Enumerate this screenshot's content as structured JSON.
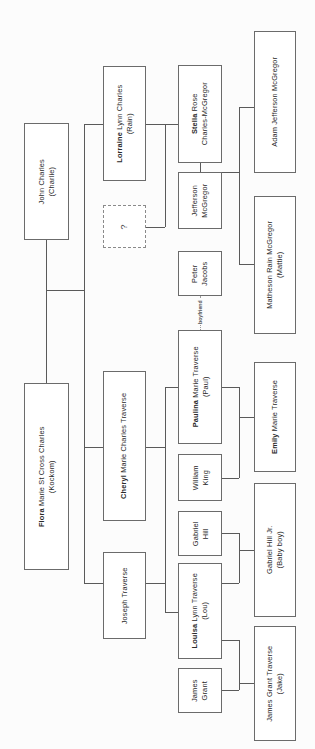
{
  "diagram": {
    "type": "family-tree",
    "orientation": "rotated-90-ccw",
    "nodes": [
      {
        "id": "john-charles",
        "name_bold": "",
        "name_rest": "John Charles",
        "alias": "(Charlie)",
        "x": 24,
        "y": 123,
        "w": 45,
        "h": 117,
        "style": "solid"
      },
      {
        "id": "flora-charles",
        "name_bold": "Flora",
        "name_rest": " Marie St Cross Charles",
        "alias": "(Kockom)",
        "x": 24,
        "y": 383,
        "w": 45,
        "h": 187,
        "style": "solid"
      },
      {
        "id": "lorraine-charles",
        "name_bold": "Lorraine",
        "name_rest": " Lynn Charles",
        "alias": "(Rain)",
        "x": 103,
        "y": 66,
        "w": 43,
        "h": 115,
        "style": "solid"
      },
      {
        "id": "unknown-partner",
        "name_bold": "",
        "name_rest": "?",
        "alias": "",
        "x": 103,
        "y": 205,
        "w": 43,
        "h": 43,
        "style": "dotted"
      },
      {
        "id": "cheryl-traverse",
        "name_bold": "Cheryl",
        "name_rest": " Marie Charles Traverse",
        "alias": "",
        "x": 103,
        "y": 371,
        "w": 43,
        "h": 150,
        "style": "solid"
      },
      {
        "id": "joseph-traverse",
        "name_bold": "",
        "name_rest": "Joseph Traverse",
        "alias": "",
        "x": 103,
        "y": 552,
        "w": 43,
        "h": 87,
        "style": "solid"
      },
      {
        "id": "stella-mcgregor",
        "name_bold": "Stella",
        "name_rest": " Rose",
        "alias": "Charles-McGregor",
        "x": 178,
        "y": 65,
        "w": 44,
        "h": 98,
        "style": "solid"
      },
      {
        "id": "jefferson-mcgregor",
        "name_bold": "",
        "name_rest": "Jefferson",
        "alias": "McGregor",
        "x": 178,
        "y": 172,
        "w": 44,
        "h": 57,
        "style": "solid"
      },
      {
        "id": "peter-jacobs",
        "name_bold": "",
        "name_rest": "Peter",
        "alias": "Jacobs",
        "x": 178,
        "y": 251,
        "w": 44,
        "h": 45,
        "style": "solid"
      },
      {
        "id": "paulina-traverse",
        "name_bold": "Paulina",
        "name_rest": " Marie Traverse",
        "alias": "(Paul)",
        "x": 178,
        "y": 330,
        "w": 44,
        "h": 114,
        "style": "solid"
      },
      {
        "id": "william-king",
        "name_bold": "",
        "name_rest": "William",
        "alias": "King",
        "x": 178,
        "y": 454,
        "w": 44,
        "h": 47,
        "style": "solid"
      },
      {
        "id": "gabriel-hill",
        "name_bold": "",
        "name_rest": "Gabriel",
        "alias": "Hill",
        "x": 178,
        "y": 511,
        "w": 44,
        "h": 45,
        "style": "solid"
      },
      {
        "id": "louisa-traverse",
        "name_bold": "Louisa",
        "name_rest": " Lynn Traverse",
        "alias": "(Lou)",
        "x": 178,
        "y": 563,
        "w": 44,
        "h": 96,
        "style": "solid"
      },
      {
        "id": "james-grant",
        "name_bold": "",
        "name_rest": "James",
        "alias": "Grant",
        "x": 178,
        "y": 668,
        "w": 44,
        "h": 45,
        "style": "solid"
      },
      {
        "id": "adam-mcgregor",
        "name_bold": "",
        "name_rest": "Adam Jefferson McGregor",
        "alias": "",
        "x": 254,
        "y": 31,
        "w": 42,
        "h": 142,
        "style": "solid"
      },
      {
        "id": "matheson-mcgregor",
        "name_bold": "",
        "name_rest": "Matheson Rain McGregor",
        "alias": "(Mattie)",
        "x": 254,
        "y": 196,
        "w": 42,
        "h": 138,
        "style": "solid"
      },
      {
        "id": "emily-traverse",
        "name_bold": "Emily",
        "name_rest": " Marie Traverse",
        "alias": "",
        "x": 254,
        "y": 362,
        "w": 42,
        "h": 110,
        "style": "solid"
      },
      {
        "id": "gabriel-hill-jr",
        "name_bold": "",
        "name_rest": "Gabriel Hill Jr.",
        "alias": "(Baby boy)",
        "x": 254,
        "y": 483,
        "w": 42,
        "h": 134,
        "style": "solid"
      },
      {
        "id": "james-grant-jake",
        "name_bold": "",
        "name_rest": "James Grant Traverse",
        "alias": "(Jake)",
        "x": 254,
        "y": 626,
        "w": 42,
        "h": 115,
        "style": "solid"
      }
    ],
    "relationship_labels": [
      {
        "id": "boyfriend-label",
        "text": "boyfriend",
        "x": 197,
        "y": 318
      }
    ],
    "colors": {
      "box_border": "#6b6b6b",
      "dotted_border": "#8a8a8a",
      "connector": "#5a5a5a",
      "text": "#2a2a2a",
      "background": "#fcfcfc"
    }
  }
}
